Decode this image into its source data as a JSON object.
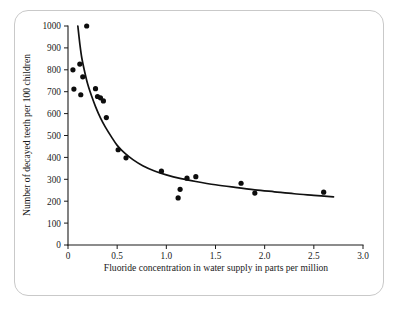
{
  "figure": {
    "frame_color": "#c9c9c9",
    "background": "#ffffff"
  },
  "chart_data": {
    "type": "scatter",
    "title": "",
    "subtitle": "",
    "xlabel": "Fluoride concentration in water supply in parts per million",
    "ylabel": "Number of decayed teeth per 100 children",
    "xlim": [
      0,
      3.0
    ],
    "ylim": [
      0,
      1000
    ],
    "grid": false,
    "legend": null,
    "xticks": [
      0,
      0.5,
      1.0,
      1.5,
      2.0,
      2.5,
      3.0
    ],
    "xtick_labels": [
      "0",
      "0.5",
      "1.0",
      "1.5",
      "2.0",
      "2.5",
      "3.0"
    ],
    "yticks": [
      0,
      100,
      200,
      300,
      400,
      500,
      600,
      700,
      800,
      900,
      1000
    ],
    "ytick_labels": [
      "0",
      "100",
      "200",
      "300",
      "400",
      "500",
      "600",
      "700",
      "800",
      "900",
      "1000"
    ],
    "marker": "filled-circle",
    "marker_color": "#0d0d0d",
    "marker_size": 2.6,
    "series": [
      {
        "name": "Observed communities",
        "type": "scatter",
        "points": [
          {
            "x": 0.05,
            "y": 800
          },
          {
            "x": 0.06,
            "y": 712
          },
          {
            "x": 0.12,
            "y": 826
          },
          {
            "x": 0.13,
            "y": 686
          },
          {
            "x": 0.15,
            "y": 768
          },
          {
            "x": 0.19,
            "y": 1000
          },
          {
            "x": 0.28,
            "y": 714
          },
          {
            "x": 0.3,
            "y": 678
          },
          {
            "x": 0.33,
            "y": 672
          },
          {
            "x": 0.36,
            "y": 658
          },
          {
            "x": 0.39,
            "y": 582
          },
          {
            "x": 0.51,
            "y": 435
          },
          {
            "x": 0.59,
            "y": 398
          },
          {
            "x": 0.95,
            "y": 337
          },
          {
            "x": 1.12,
            "y": 215
          },
          {
            "x": 1.14,
            "y": 254
          },
          {
            "x": 1.21,
            "y": 305
          },
          {
            "x": 1.3,
            "y": 312
          },
          {
            "x": 1.76,
            "y": 282
          },
          {
            "x": 1.9,
            "y": 237
          },
          {
            "x": 2.6,
            "y": 241
          }
        ]
      },
      {
        "name": "Fitted decay curve",
        "type": "line",
        "description": "Smooth inverse-power fit through the scatter, falling steeply from about 1000 near x=0.1 and flattening toward about 220 at x=2.7",
        "points": [
          {
            "x": 0.1,
            "y": 1000
          },
          {
            "x": 0.12,
            "y": 920
          },
          {
            "x": 0.14,
            "y": 855
          },
          {
            "x": 0.17,
            "y": 790
          },
          {
            "x": 0.2,
            "y": 735
          },
          {
            "x": 0.24,
            "y": 680
          },
          {
            "x": 0.28,
            "y": 632
          },
          {
            "x": 0.33,
            "y": 580
          },
          {
            "x": 0.38,
            "y": 538
          },
          {
            "x": 0.44,
            "y": 495
          },
          {
            "x": 0.5,
            "y": 455
          },
          {
            "x": 0.58,
            "y": 418
          },
          {
            "x": 0.66,
            "y": 390
          },
          {
            "x": 0.76,
            "y": 362
          },
          {
            "x": 0.88,
            "y": 338
          },
          {
            "x": 1.0,
            "y": 320
          },
          {
            "x": 1.15,
            "y": 303
          },
          {
            "x": 1.3,
            "y": 290
          },
          {
            "x": 1.5,
            "y": 275
          },
          {
            "x": 1.7,
            "y": 263
          },
          {
            "x": 1.9,
            "y": 252
          },
          {
            "x": 2.1,
            "y": 243
          },
          {
            "x": 2.3,
            "y": 234
          },
          {
            "x": 2.5,
            "y": 227
          },
          {
            "x": 2.7,
            "y": 220
          }
        ]
      }
    ]
  }
}
